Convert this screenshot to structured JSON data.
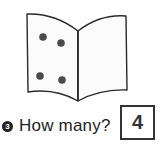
{
  "illustration": {
    "subject": "open-book",
    "dot_count": 4,
    "dot_color": "#444444",
    "line_color": "#2a2a2a"
  },
  "question": {
    "number": "3",
    "text": "How many?"
  },
  "answer": {
    "value": "4"
  }
}
